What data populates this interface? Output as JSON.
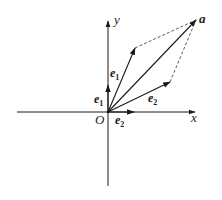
{
  "diagram": {
    "colors": {
      "stroke": "#1a1a1a",
      "background": "#ffffff"
    },
    "axes": {
      "x_label": "x",
      "y_label": "y",
      "origin_label": "O"
    },
    "vectors": [
      {
        "id": "e1-unit",
        "label_base": "e",
        "label_sub": "1",
        "from": [
          108,
          112
        ],
        "to": [
          108,
          86
        ]
      },
      {
        "id": "e2-unit",
        "label_base": "e",
        "label_sub": "2",
        "from": [
          108,
          112
        ],
        "to": [
          133,
          112
        ]
      },
      {
        "id": "e1-scaled",
        "label_base": "e",
        "label_sub": "1",
        "from": [
          108,
          112
        ],
        "to": [
          135,
          48
        ]
      },
      {
        "id": "e2-scaled",
        "label_base": "e",
        "label_sub": "2",
        "from": [
          108,
          112
        ],
        "to": [
          170,
          82
        ]
      },
      {
        "id": "a",
        "label_base": "a",
        "label_sub": "",
        "from": [
          108,
          112
        ],
        "to": [
          196,
          20
        ]
      }
    ],
    "dashed_lines": [
      {
        "from": [
          135,
          48
        ],
        "to": [
          196,
          20
        ]
      },
      {
        "from": [
          170,
          82
        ],
        "to": [
          196,
          20
        ]
      }
    ]
  }
}
